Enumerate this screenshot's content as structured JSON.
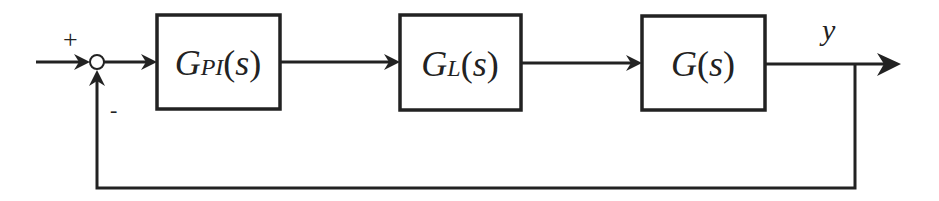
{
  "diagram": {
    "type": "feedback-control-loop",
    "colors": {
      "stroke": "#222222",
      "background": "#ffffff"
    },
    "summing_junction": {
      "plus_sign": "+",
      "minus_sign": "-"
    },
    "blocks": [
      {
        "id": "pi-controller",
        "main": "G",
        "subscript": "PI",
        "open": "(",
        "var": "s",
        "close": ")"
      },
      {
        "id": "link",
        "main": "G",
        "subscript": "L",
        "open": "(",
        "var": "s",
        "close": ")"
      },
      {
        "id": "plant",
        "main": "G",
        "subscript": "",
        "open": "(",
        "var": "s",
        "close": ")"
      }
    ],
    "output_label": "y"
  }
}
